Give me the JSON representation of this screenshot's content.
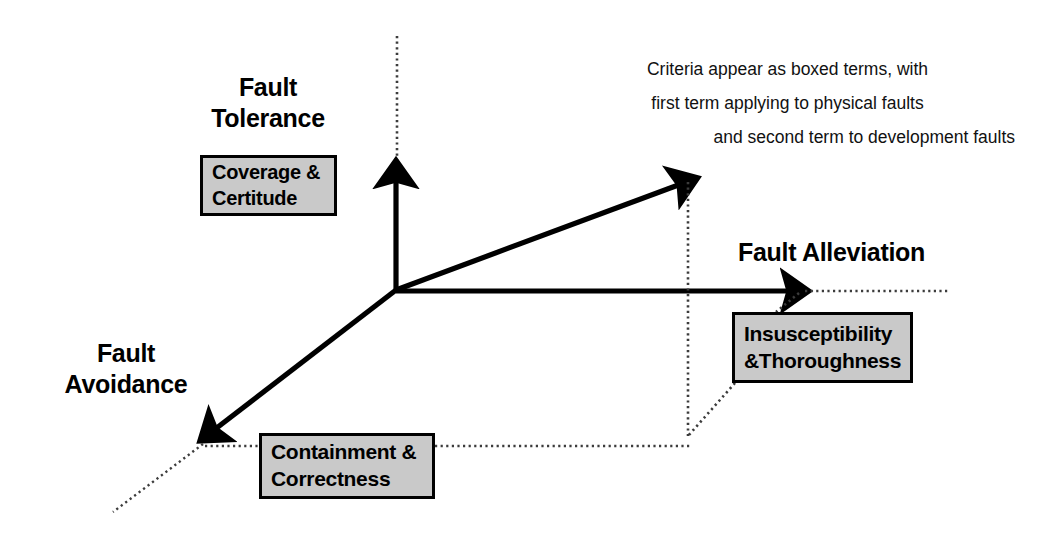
{
  "diagram": {
    "axes": [
      {
        "id": "fault-tolerance",
        "label": "Fault\nTolerance",
        "direction": "up",
        "box": "Coverage &\nCertitude"
      },
      {
        "id": "fault-avoidance",
        "label": "Fault\nAvoidance",
        "direction": "down-left",
        "box": "Containment &\nCorrectness"
      },
      {
        "id": "fault-alleviation",
        "label": "Fault Alleviation",
        "direction": "right",
        "box": "Insusceptibility\n&Thoroughness"
      }
    ],
    "labels": {
      "fault_tolerance": "Fault\nTolerance",
      "fault_avoidance": "Fault\nAvoidance",
      "fault_alleviation": "Fault Alleviation"
    },
    "boxes": {
      "coverage_certitude": "Coverage &\nCertitude",
      "containment_correctness": "Containment &\nCorrectness",
      "insusceptibility_thoroughness": "Insusceptibility\n&Thoroughness"
    },
    "annotation": {
      "line_1": "Criteria appear as boxed terms, with",
      "line_2": "first term applying to physical faults",
      "line_3": "and second term to development faults"
    },
    "colors": {
      "background": "#ffffff",
      "stroke": "#000000",
      "box_fill": "#c9c9c9",
      "dotted": "#4a4a4a"
    }
  }
}
